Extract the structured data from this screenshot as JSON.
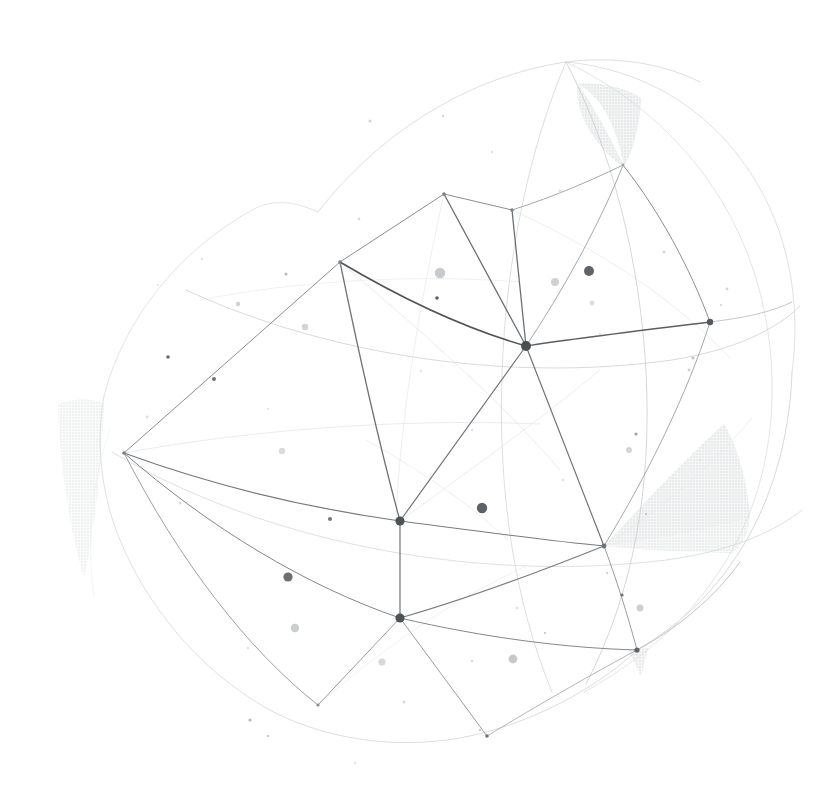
{
  "meta": {
    "title": "Abstract Geometric Wireframe Sphere",
    "width": 828,
    "height": 801,
    "background": "#ffffff"
  },
  "palette": {
    "background": "#ffffff",
    "line_strong": "#555a5e",
    "line_medium": "#8d9297",
    "line_faint": "#c3c7ca",
    "line_ghost": "#e4e6e7",
    "node_dark": "#4a4f54",
    "node_mid": "#9aa0a4",
    "shade_fill": "#e6e7e8",
    "shade_fill_light": "#f1f2f2",
    "speckle_dark": "#5b6065",
    "speckle_mid": "#b9bdc0",
    "speckle_light": "#dfe1e2"
  },
  "shaded_facets": [
    {
      "name": "facet-top-crescent",
      "fill": "#e4e5e6",
      "opacity": 0.95,
      "path": "M 578 84 C 600 96 616 122 624 166 C 610 160 594 140 584 120 C 578 106 576 94 578 84 Z M 578 84 C 596 110 612 142 624 166 C 634 150 640 122 641 98 C 626 88 600 82 578 84 Z"
    },
    {
      "name": "facet-right-large",
      "fill": "#e6e7e8",
      "opacity": 0.95,
      "path": "M 604 546 C 640 508 682 462 724 424 C 740 452 748 486 750 518 C 716 528 664 539 604 546 Z"
    },
    {
      "name": "facet-right-lower",
      "fill": "#eceded",
      "opacity": 0.9,
      "path": "M 604 546 C 660 540 712 530 750 518 C 748 534 742 546 732 553 C 690 552 646 550 604 546 Z"
    },
    {
      "name": "facet-bottom-right-small",
      "fill": "#e9eaea",
      "opacity": 0.9,
      "path": "M 628 650 L 648 648 L 641 676 Z"
    },
    {
      "name": "facet-left-sliver",
      "fill": "#f3f4f4",
      "opacity": 0.85,
      "path": "M 58 404 C 76 398 92 398 104 404 C 102 460 96 520 84 578 C 70 530 60 468 58 404 Z"
    }
  ],
  "outer_arcs": [
    {
      "name": "arc-outer-top-left",
      "stroke": "#d8dadc",
      "width": 0.9,
      "d": "M 318 212 C 380 132 470 76 566 62 C 612 56 660 62 700 82"
    },
    {
      "name": "arc-outer-top-right",
      "stroke": "#dcdee0",
      "width": 0.9,
      "d": "M 566 62 C 654 70 726 120 766 200 C 792 252 800 314 792 372"
    },
    {
      "name": "arc-outer-right",
      "stroke": "#d2d5d7",
      "width": 0.9,
      "d": "M 792 372 C 790 440 770 508 734 560 C 710 596 678 626 640 648"
    },
    {
      "name": "arc-outer-bottom",
      "stroke": "#d7d9db",
      "width": 0.9,
      "d": "M 640 648 C 590 694 524 726 460 738 C 392 750 320 738 266 708"
    },
    {
      "name": "arc-outer-left-low",
      "stroke": "#dadcde",
      "width": 0.9,
      "d": "M 266 708 C 200 670 148 608 120 540 C 100 492 96 440 104 396"
    },
    {
      "name": "arc-outer-left-up",
      "stroke": "#dfe1e3",
      "width": 0.9,
      "d": "M 104 396 C 124 318 180 250 252 210 C 274 198 296 202 318 212"
    }
  ],
  "meridians": [
    {
      "name": "meridian-1",
      "stroke": "#c9cccf",
      "width": 0.8,
      "d": "M 566 62 C 612 150 640 260 646 372 C 652 486 634 592 586 684"
    },
    {
      "name": "meridian-2",
      "stroke": "#d3d6d8",
      "width": 0.8,
      "d": "M 566 62 C 530 146 506 258 502 374 C 498 492 514 600 552 692"
    },
    {
      "name": "meridian-3",
      "stroke": "#dcdee0",
      "width": 0.8,
      "d": "M 566 62 C 700 126 776 252 772 400 C 768 534 694 632 584 692"
    },
    {
      "name": "parallel-upper",
      "stroke": "#cdd0d3",
      "width": 0.8,
      "d": "M 186 290 C 320 352 500 384 672 360 C 734 350 776 330 800 306"
    },
    {
      "name": "parallel-mid",
      "stroke": "#d6d8da",
      "width": 0.8,
      "d": "M 112 452 C 260 540 470 584 666 560 C 726 552 772 534 802 510"
    }
  ],
  "mesh_edges": [
    {
      "name": "edge-hub-to-north",
      "stroke": "#6b7074",
      "width": 1.3,
      "d": "M 526 346 L 512 210"
    },
    {
      "name": "edge-hub-to-nw",
      "stroke": "#6b7074",
      "width": 1.3,
      "d": "M 526 346 L 444 194"
    },
    {
      "name": "edge-hub-to-west",
      "stroke": "#4f5458",
      "width": 1.6,
      "d": "M 526 346 C 470 330 404 300 340 262"
    },
    {
      "name": "edge-hub-to-east",
      "stroke": "#5a5f63",
      "width": 1.5,
      "d": "M 526 346 C 578 338 646 330 710 322"
    },
    {
      "name": "edge-hub-to-sw",
      "stroke": "#70757a",
      "width": 1.2,
      "d": "M 526 346 L 400 521"
    },
    {
      "name": "edge-hub-to-south",
      "stroke": "#70757a",
      "width": 1.2,
      "d": "M 526 346 L 604 546"
    },
    {
      "name": "edge-nw-to-west",
      "stroke": "#8a8f93",
      "width": 1.0,
      "d": "M 444 194 L 340 262"
    },
    {
      "name": "edge-nw-to-north",
      "stroke": "#8a8f93",
      "width": 1.0,
      "d": "M 444 194 L 512 210"
    },
    {
      "name": "edge-north-to-crest",
      "stroke": "#999ea2",
      "width": 0.9,
      "d": "M 512 210 C 556 196 592 180 623 165"
    },
    {
      "name": "edge-crest-to-east",
      "stroke": "#8b9094",
      "width": 1.0,
      "d": "M 623 165 C 660 212 690 268 710 322"
    },
    {
      "name": "edge-crest-to-hub",
      "stroke": "#9a9fa3",
      "width": 0.9,
      "d": "M 623 165 C 600 224 562 292 526 346"
    },
    {
      "name": "edge-west-to-far-w",
      "stroke": "#8a8f93",
      "width": 1.0,
      "d": "M 340 262 L 124 453"
    },
    {
      "name": "edge-west-to-sw",
      "stroke": "#6f7478",
      "width": 1.3,
      "d": "M 340 262 C 356 340 378 440 400 521"
    },
    {
      "name": "edge-farw-to-sw",
      "stroke": "#74797d",
      "width": 1.2,
      "d": "M 124 453 C 214 486 308 508 400 521"
    },
    {
      "name": "edge-farw-to-south",
      "stroke": "#82878b",
      "width": 1.0,
      "d": "M 124 453 C 210 528 306 586 400 618"
    },
    {
      "name": "edge-farw-to-bl",
      "stroke": "#90959a",
      "width": 0.9,
      "d": "M 124 453 C 180 562 248 650 318 705"
    },
    {
      "name": "edge-sw-to-south",
      "stroke": "#6f7478",
      "width": 1.2,
      "d": "M 400 521 L 400 618"
    },
    {
      "name": "edge-sw-to-se",
      "stroke": "#777c80",
      "width": 1.1,
      "d": "M 400 521 C 470 530 540 540 604 546"
    },
    {
      "name": "edge-south-to-se",
      "stroke": "#777c80",
      "width": 1.1,
      "d": "M 400 618 C 470 598 544 570 604 546"
    },
    {
      "name": "edge-south-to-bl",
      "stroke": "#8d9296",
      "width": 0.9,
      "d": "M 400 618 L 318 705"
    },
    {
      "name": "edge-south-to-bs",
      "stroke": "#8d9296",
      "width": 0.9,
      "d": "M 400 618 L 487 736"
    },
    {
      "name": "edge-south-to-br",
      "stroke": "#83888c",
      "width": 1.0,
      "d": "M 400 618 C 486 638 566 648 637 650"
    },
    {
      "name": "edge-se-to-br",
      "stroke": "#8d9296",
      "width": 0.9,
      "d": "M 604 546 C 616 578 628 616 637 650"
    },
    {
      "name": "edge-bs-to-br",
      "stroke": "#a0a4a8",
      "width": 0.8,
      "d": "M 487 736 C 540 704 592 674 637 650"
    },
    {
      "name": "edge-east-to-se",
      "stroke": "#9a9fa3",
      "width": 0.9,
      "d": "M 710 322 C 688 392 648 474 604 546"
    },
    {
      "name": "edge-east-to-outer",
      "stroke": "#b4b8bb",
      "width": 0.8,
      "d": "M 710 322 C 744 318 772 312 792 302"
    },
    {
      "name": "edge-br-to-outer",
      "stroke": "#b0b4b7",
      "width": 0.8,
      "d": "M 637 650 C 678 628 714 598 740 562"
    }
  ],
  "ghost_edges": [
    {
      "name": "ghost-1",
      "stroke": "#e6e8e9",
      "width": 0.8,
      "d": "M 340 262 C 420 330 500 400 560 470"
    },
    {
      "name": "ghost-2",
      "stroke": "#e8eaeb",
      "width": 0.8,
      "d": "M 444 194 C 420 300 400 420 396 520"
    },
    {
      "name": "ghost-3",
      "stroke": "#e4e6e7",
      "width": 0.8,
      "d": "M 124 453 C 250 430 400 418 540 424"
    },
    {
      "name": "ghost-4",
      "stroke": "#eceded",
      "width": 0.8,
      "d": "M 318 705 C 380 650 452 600 526 566"
    },
    {
      "name": "ghost-5",
      "stroke": "#e9eaeb",
      "width": 0.8,
      "d": "M 512 210 C 600 250 676 300 730 358"
    },
    {
      "name": "ghost-6",
      "stroke": "#e7e8e9",
      "width": 0.8,
      "d": "M 400 521 C 470 470 540 420 600 370"
    },
    {
      "name": "ghost-7",
      "stroke": "#edeeee",
      "width": 0.8,
      "d": "M 200 300 C 300 280 420 274 520 282"
    },
    {
      "name": "ghost-8",
      "stroke": "#eaebec",
      "width": 0.8,
      "d": "M 604 546 C 660 510 712 466 752 418"
    },
    {
      "name": "ghost-9",
      "stroke": "#e9eaeb",
      "width": 0.8,
      "d": "M 366 440 C 420 470 470 504 508 540"
    },
    {
      "name": "ghost-10",
      "stroke": "#f0f1f1",
      "width": 0.8,
      "d": "M 110 430 C 92 480 86 540 94 596"
    }
  ],
  "nodes": [
    {
      "name": "node-hub",
      "x": 526,
      "y": 346,
      "r": 5.0,
      "fill": "#4a4f54"
    },
    {
      "name": "node-southwest",
      "x": 400,
      "y": 521,
      "r": 4.6,
      "fill": "#4d5257"
    },
    {
      "name": "node-south",
      "x": 400,
      "y": 618,
      "r": 4.6,
      "fill": "#4d5257"
    },
    {
      "name": "node-east",
      "x": 710,
      "y": 322,
      "r": 3.2,
      "fill": "#55595e"
    },
    {
      "name": "node-southeast",
      "x": 604,
      "y": 546,
      "r": 2.4,
      "fill": "#6d7276"
    },
    {
      "name": "node-bottom-right",
      "x": 637,
      "y": 650,
      "r": 2.6,
      "fill": "#5e6368"
    },
    {
      "name": "node-north",
      "x": 512,
      "y": 210,
      "r": 1.8,
      "fill": "#7b8084"
    },
    {
      "name": "node-northwest",
      "x": 444,
      "y": 194,
      "r": 1.8,
      "fill": "#7b8084"
    },
    {
      "name": "node-west",
      "x": 340,
      "y": 262,
      "r": 1.8,
      "fill": "#7b8084"
    },
    {
      "name": "node-far-west",
      "x": 124,
      "y": 453,
      "r": 1.8,
      "fill": "#7b8084"
    },
    {
      "name": "node-bottom-left",
      "x": 318,
      "y": 705,
      "r": 1.6,
      "fill": "#888d91"
    },
    {
      "name": "node-bottom-south",
      "x": 487,
      "y": 736,
      "r": 1.8,
      "fill": "#6f7478"
    },
    {
      "name": "node-crest",
      "x": 623,
      "y": 165,
      "r": 1.4,
      "fill": "#9da2a6"
    }
  ],
  "speckles": [
    {
      "x": 589,
      "y": 271,
      "r": 5.0,
      "fill": "#5f6469"
    },
    {
      "x": 482,
      "y": 508,
      "r": 5.2,
      "fill": "#5d6267"
    },
    {
      "x": 288,
      "y": 577,
      "r": 4.6,
      "fill": "#6a6f74"
    },
    {
      "x": 440,
      "y": 273,
      "r": 5.2,
      "fill": "#c8cbcd"
    },
    {
      "x": 555,
      "y": 282,
      "r": 4.0,
      "fill": "#cfd2d4"
    },
    {
      "x": 513,
      "y": 659,
      "r": 4.4,
      "fill": "#c6c9cb"
    },
    {
      "x": 295,
      "y": 628,
      "r": 4.2,
      "fill": "#cbced0"
    },
    {
      "x": 629,
      "y": 450,
      "r": 3.0,
      "fill": "#d4d7d9"
    },
    {
      "x": 640,
      "y": 608,
      "r": 3.4,
      "fill": "#cdd0d2"
    },
    {
      "x": 382,
      "y": 662,
      "r": 3.6,
      "fill": "#d7dadc"
    },
    {
      "x": 282,
      "y": 451,
      "r": 3.2,
      "fill": "#d9dcde"
    },
    {
      "x": 305,
      "y": 327,
      "r": 3.2,
      "fill": "#d2d5d7"
    },
    {
      "x": 238,
      "y": 304,
      "r": 2.2,
      "fill": "#cfd2d4"
    },
    {
      "x": 214,
      "y": 379,
      "r": 2.0,
      "fill": "#6d7276"
    },
    {
      "x": 330,
      "y": 519,
      "r": 2.0,
      "fill": "#72777b"
    },
    {
      "x": 437,
      "y": 298,
      "r": 1.8,
      "fill": "#5c6166"
    },
    {
      "x": 168,
      "y": 357,
      "r": 1.8,
      "fill": "#646a6e"
    },
    {
      "x": 622,
      "y": 595,
      "r": 1.6,
      "fill": "#6b7074"
    },
    {
      "x": 592,
      "y": 303,
      "r": 2.4,
      "fill": "#dbdde0"
    },
    {
      "x": 636,
      "y": 434,
      "r": 1.6,
      "fill": "#9ba0a4"
    },
    {
      "x": 286,
      "y": 274,
      "r": 1.6,
      "fill": "#b9bdc0"
    },
    {
      "x": 370,
      "y": 121,
      "r": 1.6,
      "fill": "#d3d6d8"
    },
    {
      "x": 443,
      "y": 116,
      "r": 1.4,
      "fill": "#d9dbdd"
    },
    {
      "x": 560,
      "y": 191,
      "r": 1.4,
      "fill": "#dcdee0"
    },
    {
      "x": 359,
      "y": 219,
      "r": 1.4,
      "fill": "#d7d9db"
    },
    {
      "x": 664,
      "y": 252,
      "r": 1.4,
      "fill": "#d2d5d7"
    },
    {
      "x": 693,
      "y": 358,
      "r": 1.6,
      "fill": "#c4c8ca"
    },
    {
      "x": 689,
      "y": 370,
      "r": 1.4,
      "fill": "#cfd2d4"
    },
    {
      "x": 404,
      "y": 702,
      "r": 1.4,
      "fill": "#d6d8da"
    },
    {
      "x": 250,
      "y": 720,
      "r": 1.6,
      "fill": "#b8bcbf"
    },
    {
      "x": 268,
      "y": 736,
      "r": 1.2,
      "fill": "#c9cccf"
    },
    {
      "x": 480,
      "y": 730,
      "r": 1.2,
      "fill": "#c5c8cb"
    },
    {
      "x": 545,
      "y": 633,
      "r": 1.2,
      "fill": "#cdd0d2"
    },
    {
      "x": 472,
      "y": 661,
      "r": 1.2,
      "fill": "#d9dbdd"
    },
    {
      "x": 607,
      "y": 573,
      "r": 1.2,
      "fill": "#d3d6d8"
    },
    {
      "x": 517,
      "y": 608,
      "r": 1.2,
      "fill": "#dbdde0"
    },
    {
      "x": 180,
      "y": 503,
      "r": 1.4,
      "fill": "#d8dadc"
    },
    {
      "x": 147,
      "y": 417,
      "r": 1.4,
      "fill": "#dcdee0"
    },
    {
      "x": 248,
      "y": 648,
      "r": 1.2,
      "fill": "#dde0e1"
    },
    {
      "x": 727,
      "y": 289,
      "r": 1.4,
      "fill": "#d3d6d8"
    },
    {
      "x": 721,
      "y": 305,
      "r": 1.2,
      "fill": "#dbdde0"
    },
    {
      "x": 646,
      "y": 514,
      "r": 1.2,
      "fill": "#c6c9cb"
    },
    {
      "x": 421,
      "y": 371,
      "r": 1.2,
      "fill": "#e0e2e3"
    },
    {
      "x": 472,
      "y": 430,
      "r": 1.2,
      "fill": "#e1e3e4"
    },
    {
      "x": 563,
      "y": 480,
      "r": 1.2,
      "fill": "#dee0e1"
    },
    {
      "x": 600,
      "y": 334,
      "r": 1.2,
      "fill": "#dfe1e2"
    },
    {
      "x": 202,
      "y": 259,
      "r": 1.2,
      "fill": "#e1e3e4"
    },
    {
      "x": 492,
      "y": 152,
      "r": 1.2,
      "fill": "#e2e4e5"
    },
    {
      "x": 700,
      "y": 460,
      "r": 1.2,
      "fill": "#dde0e1"
    },
    {
      "x": 355,
      "y": 763,
      "r": 1.2,
      "fill": "#e0e2e3"
    },
    {
      "x": 268,
      "y": 409,
      "r": 1.0,
      "fill": "#dfe1e2"
    },
    {
      "x": 158,
      "y": 285,
      "r": 1.0,
      "fill": "#e0e2e3"
    }
  ]
}
